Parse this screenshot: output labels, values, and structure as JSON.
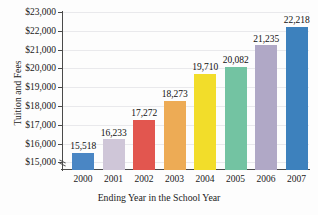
{
  "chart_data": {
    "type": "bar",
    "title": "",
    "xlabel": "Ending Year in the School Year",
    "ylabel": "Tuition and Fees",
    "categories": [
      "2000",
      "2001",
      "2002",
      "2003",
      "2004",
      "2005",
      "2006",
      "2007"
    ],
    "values": [
      15518,
      16233,
      17272,
      18273,
      19710,
      20082,
      21235,
      22218
    ],
    "data_labels": [
      "15,518",
      "16,233",
      "17,272",
      "18,273",
      "19,710",
      "20,082",
      "21,235",
      "22,218"
    ],
    "ylim": [
      14600,
      23000
    ],
    "yticks": [
      15000,
      16000,
      17000,
      18000,
      19000,
      20000,
      21000,
      22000,
      23000
    ],
    "ytick_labels": [
      "$15,000",
      "$16,000",
      "$17,000",
      "$18,000",
      "$19,000",
      "$20,000",
      "$21,000",
      "$22,000",
      "$23,000"
    ],
    "grid": true,
    "legend": "none",
    "axis_break": true,
    "bar_colors": [
      "#4a86c4",
      "#cfc6d8",
      "#e2564f",
      "#edab55",
      "#f2dd2a",
      "#73c3a2",
      "#b0a8c6",
      "#3d81bd"
    ]
  }
}
